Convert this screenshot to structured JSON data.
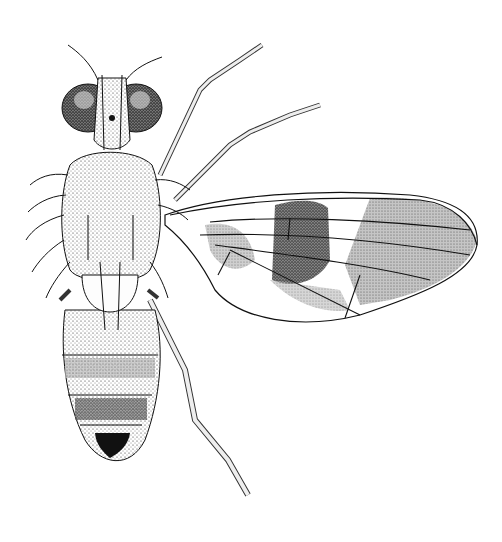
{
  "figure": {
    "style": "black-and-white stipple line drawing",
    "background_color": "#ffffff",
    "ink_color": "#111111",
    "parts": {
      "head": "head with compound eyes",
      "thorax": "thorax (scutum)",
      "scutellum": "scutellum",
      "abdomen": "abdomen",
      "wing": "right wing with banded pattern",
      "legs": "legs"
    }
  }
}
